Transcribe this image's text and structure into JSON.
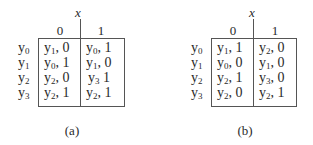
{
  "figures": [
    {
      "id": "a",
      "caption": "(a)",
      "input_variable": "x",
      "columns": [
        "0",
        "1"
      ],
      "rows": [
        {
          "label": "y",
          "sub": "0",
          "cells": [
            {
              "state": "y",
              "sub": "1",
              "sep": ",",
              "out": "0"
            },
            {
              "state": "y",
              "sub": "0",
              "sep": ",",
              "out": "1"
            }
          ]
        },
        {
          "label": "y",
          "sub": "1",
          "cells": [
            {
              "state": "y",
              "sub": "0",
              "sep": ",",
              "out": "1"
            },
            {
              "state": "y",
              "sub": "1",
              "sep": ",",
              "out": "0"
            }
          ]
        },
        {
          "label": "y",
          "sub": "2",
          "cells": [
            {
              "state": "y",
              "sub": "2",
              "sep": ",",
              "out": "0"
            },
            {
              "state": "y",
              "sub": "3",
              "sep": "",
              "out": "1"
            }
          ]
        },
        {
          "label": "y",
          "sub": "3",
          "cells": [
            {
              "state": "y",
              "sub": "2",
              "sep": ",",
              "out": "1"
            },
            {
              "state": "y",
              "sub": "2",
              "sep": ",",
              "out": "1"
            }
          ]
        }
      ]
    },
    {
      "id": "b",
      "caption": "(b)",
      "input_variable": "x",
      "columns": [
        "0",
        "1"
      ],
      "rows": [
        {
          "label": "y",
          "sub": "0",
          "cells": [
            {
              "state": "y",
              "sub": "1",
              "sep": ",",
              "out": "1"
            },
            {
              "state": "y",
              "sub": "2",
              "sep": ",",
              "out": "0"
            }
          ]
        },
        {
          "label": "y",
          "sub": "1",
          "cells": [
            {
              "state": "y",
              "sub": "0",
              "sep": ",",
              "out": "0"
            },
            {
              "state": "y",
              "sub": "1",
              "sep": ",",
              "out": "0"
            }
          ]
        },
        {
          "label": "y",
          "sub": "2",
          "cells": [
            {
              "state": "y",
              "sub": "2",
              "sep": ",",
              "out": "1"
            },
            {
              "state": "y",
              "sub": "3",
              "sep": ",",
              "out": "0"
            }
          ]
        },
        {
          "label": "y",
          "sub": "3",
          "cells": [
            {
              "state": "y",
              "sub": "2",
              "sep": ",",
              "out": "0"
            },
            {
              "state": "y",
              "sub": "2",
              "sep": ",",
              "out": "1"
            }
          ]
        }
      ]
    }
  ]
}
